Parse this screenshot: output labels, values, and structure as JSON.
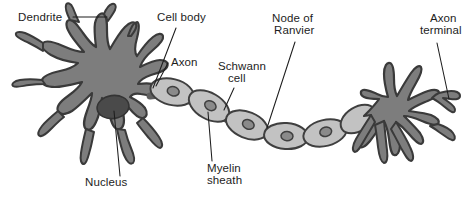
{
  "figure": {
    "background_color": "#ffffff",
    "width": 472,
    "height": 209
  },
  "palette": {
    "soma_fill": "#7d7d7d",
    "soma_outline": "#3a3a3a",
    "nucleus_fill": "#4a4a4a",
    "myelin_fill": "#c2c2c2",
    "myelin_outline": "#3f3f3f",
    "schwann_nucleus_fill": "#8a8a8a",
    "node_fill": "#6e6e6e",
    "label_color": "#1d1d1d",
    "leader_color": "#1d1d1d"
  },
  "labels": [
    {
      "id": "dendrite",
      "name": "Dendrite",
      "lines": [
        "Dendrite"
      ],
      "x": 18,
      "y": 21,
      "anchor": "start"
    },
    {
      "id": "cell-body",
      "name": "Cell body",
      "lines": [
        "Cell body"
      ],
      "x": 157,
      "y": 21,
      "anchor": "start"
    },
    {
      "id": "axon",
      "name": "Axon",
      "lines": [
        "Axon"
      ],
      "x": 171,
      "y": 66,
      "anchor": "start"
    },
    {
      "id": "schwann-cell",
      "name": "Schwann cell",
      "lines": [
        "Schwann",
        "cell"
      ],
      "x": 218,
      "y": 70,
      "anchor": "start"
    },
    {
      "id": "node-ranvier",
      "name": "Node of Ranvier",
      "lines": [
        "Node of",
        "Ranvier"
      ],
      "x": 272,
      "y": 22,
      "anchor": "start"
    },
    {
      "id": "axon-terminal",
      "name": "Axon terminal",
      "lines": [
        "Axon",
        "terminal"
      ],
      "x": 424,
      "y": 22,
      "anchor": "start"
    },
    {
      "id": "nucleus",
      "name": "Nucleus",
      "lines": [
        "Nucleus"
      ],
      "x": 85,
      "y": 186,
      "anchor": "start"
    },
    {
      "id": "myelin-sheath",
      "name": "Myelin sheath",
      "lines": [
        "Myelin",
        "sheath"
      ],
      "x": 207,
      "y": 172,
      "anchor": "start"
    }
  ],
  "structures": {
    "dendrites_left": "branching dendritic arbor on the left of the soma",
    "soma": "large star-shaped cell body",
    "nucleus": "dark ellipse inside the soma",
    "axon": "myelinated axon extending right from the soma",
    "myelin_segments": 6,
    "nodes_of_ranvier": 5,
    "axon_terminal_arbor": "branching terminal arbor on the right"
  }
}
